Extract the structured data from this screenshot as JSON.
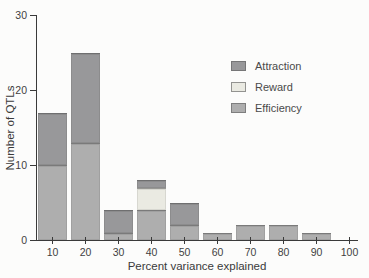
{
  "figure": {
    "background": "#fcfcfb",
    "axis_color": "#3a3a3a",
    "text_color": "#3f3f3f"
  },
  "chart_data": {
    "type": "bar",
    "stacked": true,
    "title": "",
    "xlabel": "Percent variance explained",
    "ylabel": "Number of QTLs",
    "categories": [
      10,
      20,
      30,
      40,
      50,
      60,
      70,
      80,
      90
    ],
    "x_ticks": [
      10,
      20,
      30,
      40,
      50,
      60,
      70,
      80,
      90,
      100
    ],
    "y_ticks": [
      0,
      10,
      20,
      30
    ],
    "xlim": [
      5,
      105
    ],
    "ylim": [
      0,
      30
    ],
    "grid": false,
    "legend_position": "upper-right",
    "legend_order": [
      "Attraction",
      "Reward",
      "Efficiency"
    ],
    "series": [
      {
        "name": "Efficiency",
        "color": "#aeaeae",
        "values": [
          10,
          13,
          1,
          4,
          2,
          1,
          2,
          2,
          1
        ]
      },
      {
        "name": "Reward",
        "color": "#eaeae2",
        "values": [
          0,
          0,
          0,
          3,
          0,
          0,
          0,
          0,
          0
        ]
      },
      {
        "name": "Attraction",
        "color": "#98989a",
        "values": [
          7,
          12,
          3,
          1,
          3,
          0,
          0,
          0,
          0
        ]
      }
    ]
  }
}
